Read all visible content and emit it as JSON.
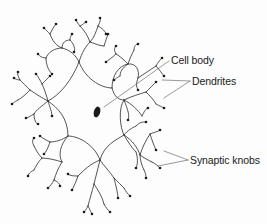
{
  "diagram": {
    "labels": {
      "cell_body": "Cell body",
      "dendrites": "Dendrites",
      "synaptic_knobs": "Synaptic knobs"
    },
    "colors": {
      "line": "#2a2a2a",
      "nucleus": "#1a1a1a",
      "background": "#fdfdfd"
    }
  }
}
